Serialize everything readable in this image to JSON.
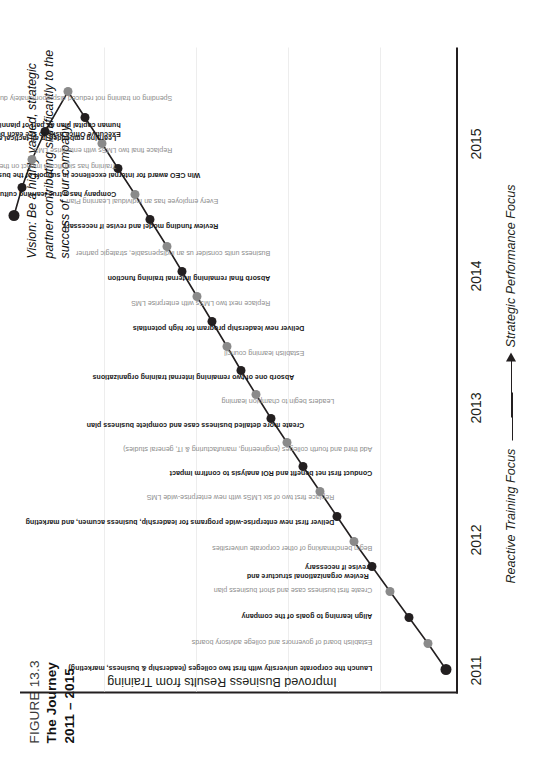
{
  "figure": {
    "number": "FIGURE 13.3",
    "title_line1": "The Journey",
    "title_line2": "2011 – 2015"
  },
  "vision": {
    "text": "Vision: Be a highly valued, strategic partner contributing significantly to the success of our company."
  },
  "axes": {
    "ylabel": "Improved Business Results from Training",
    "xticks": [
      "2011",
      "2012",
      "2013",
      "2014",
      "2015"
    ],
    "footer_left": "Reactive Training Focus",
    "footer_right": "Strategic Performance Focus"
  },
  "chart_data": {
    "type": "line",
    "title": "The Journey 2011 – 2015",
    "xlabel": "",
    "ylabel": "Improved Business Results from Training",
    "xlim": [
      2010.8,
      2015.6
    ],
    "ylim": [
      0,
      100
    ],
    "grid": true,
    "legend": null,
    "xticks": [
      "2011",
      "2012",
      "2013",
      "2014",
      "2015"
    ],
    "annotations": {
      "vision": "Vision: Be a highly valued, strategic partner contributing significantly to the success of our company.",
      "footer_left": "Reactive Training Focus",
      "footer_right": "Strategic Performance Focus"
    },
    "series": [
      {
        "name": "Journey milestones",
        "points": [
          {
            "x": 2011.0,
            "y": 2,
            "style": "dark",
            "label": "Launch the corporate university with first two colleges (leadership & business, marketing)"
          },
          {
            "x": 2011.17,
            "y": 6,
            "style": "gray",
            "label": "Establish board of governors and college advisory boards"
          },
          {
            "x": 2011.33,
            "y": 11,
            "style": "dark",
            "label": "Align learning to goals of the company"
          },
          {
            "x": 2011.5,
            "y": 16,
            "style": "gray",
            "label": "Create first business case and short business plan"
          },
          {
            "x": 2011.67,
            "y": 21,
            "style": "dark",
            "label": "Review organizational structure and revise if necessary"
          },
          {
            "x": 2011.84,
            "y": 26,
            "style": "gray",
            "label": "Begin benchmarking of other corporate universities"
          },
          {
            "x": 2012.0,
            "y": 31,
            "style": "dark",
            "label": "Deliver first new enterprise-wide programs for leadership, business acumen, and marketing"
          },
          {
            "x": 2012.17,
            "y": 36,
            "style": "gray",
            "label": "Replace first two of six LMSs with new enterprise-wide LMS"
          },
          {
            "x": 2012.34,
            "y": 41,
            "style": "dark",
            "label": "Conduct first net benefit and ROI analysis to confirm impact"
          },
          {
            "x": 2012.52,
            "y": 46,
            "style": "gray",
            "label": "Add third and fourth colleges (engineering, manufacturing & IT, general studies)"
          },
          {
            "x": 2012.7,
            "y": 51,
            "style": "dark",
            "label": "Create more detailed business case and complete business plan"
          },
          {
            "x": 2012.88,
            "y": 55,
            "style": "gray",
            "label": "Leaders begin to champion learning"
          },
          {
            "x": 2013.06,
            "y": 60,
            "style": "dark",
            "label": "Absorb one of two remaining internal training organizations"
          },
          {
            "x": 2013.26,
            "y": 64,
            "style": "gray",
            "label": "Establish learning council"
          },
          {
            "x": 2013.46,
            "y": 68,
            "style": "dark",
            "label": "Deliver new leadership program for high potentials"
          },
          {
            "x": 2013.7,
            "y": 72,
            "style": "gray",
            "label": "Replace next two LMSs with enterprise LMS"
          },
          {
            "x": 2013.94,
            "y": 76,
            "style": "dark",
            "label": "Absorb final remaining internal training function"
          },
          {
            "x": 2014.16,
            "y": 79,
            "style": "gray",
            "label": "Business units consider us an indispensable, strategic partner"
          },
          {
            "x": 2014.36,
            "y": 82,
            "style": "dark",
            "label": "Review funding model and revise if necessary"
          },
          {
            "x": 2014.56,
            "y": 85,
            "style": "gray",
            "label": "Every employee has an Individual Learning Plan"
          },
          {
            "x": 2014.8,
            "y": 88,
            "style": "dark",
            "label": "Win CEO award for internal excellence in support of the business"
          },
          {
            "x": 2015.04,
            "y": 90,
            "style": "gray",
            "label": "Replace final two LMSs with enterprise LMS"
          },
          {
            "x": 2015.28,
            "y": 93,
            "style": "dark",
            "label": "Executive Office asks to see each business unit's human capital plan as part of planning review"
          },
          {
            "x": 2015.52,
            "y": 95,
            "style": "gray",
            "label": "Spending on training not reduced disproportionately during downturns"
          },
          {
            "x": 2015.76,
            "y": 96,
            "style": "dark",
            "label": "Learning embedded in all tactical and strategic plans"
          },
          {
            "x": 2016.0,
            "y": 97,
            "style": "gray",
            "label": "Training has significant impact on the company's overall success"
          },
          {
            "x": 2016.24,
            "y": 98,
            "style": "dark",
            "label": "Company has a true learning culture"
          },
          {
            "x": 2016.48,
            "y": 99,
            "style": "dark",
            "label": ""
          }
        ]
      }
    ]
  },
  "milestones": [
    {
      "label": "Launch the corporate university with first two colleges (leadership & business, marketing)",
      "style": "dark",
      "px": 110,
      "py": 446,
      "lx": 112,
      "ly": 368
    },
    {
      "label": "Establish board of governors and college advisory boards",
      "style": "gray",
      "px": 136,
      "py": 428,
      "lx": 138,
      "ly": 368
    },
    {
      "label": "Align learning to goals of the company",
      "style": "dark",
      "px": 162,
      "py": 409,
      "lx": 164,
      "ly": 368
    },
    {
      "label": "Create first business case and short business plan",
      "style": "gray",
      "px": 188,
      "py": 390,
      "lx": 190,
      "ly": 368
    },
    {
      "label": "Review organizational structure and\nrevise if necessary",
      "style": "dark",
      "px": 213,
      "py": 372,
      "lx": 208,
      "ly": 360
    },
    {
      "label": "Begin benchmarking of other corporate universities",
      "style": "gray",
      "px": 238,
      "py": 354,
      "lx": 232,
      "ly": 368
    },
    {
      "label": "Deliver first new enterprise-wide programs for leadership, business acumen, and marketing",
      "style": "dark",
      "px": 263,
      "py": 337,
      "lx": 258,
      "ly": 330
    },
    {
      "label": "Replace first two of six LMSs with new enterprise-wide LMS",
      "style": "gray",
      "px": 288,
      "py": 320,
      "lx": 283,
      "ly": 330
    },
    {
      "label": "Conduct first net benefit and ROI analysis to confirm impact",
      "style": "dark",
      "px": 313,
      "py": 303,
      "lx": 307,
      "ly": 368
    },
    {
      "label": "Add third and fourth colleges (engineering, manufacturing & IT, general studies)",
      "style": "gray",
      "px": 337,
      "py": 287,
      "lx": 331,
      "ly": 368
    },
    {
      "label": "Create more detailed business case and complete business plan",
      "style": "dark",
      "px": 361,
      "py": 271,
      "lx": 355,
      "ly": 300
    },
    {
      "label": "Leaders begin to champion learning",
      "style": "gray",
      "px": 385,
      "py": 256,
      "lx": 379,
      "ly": 330
    },
    {
      "label": "Absorb one of two remaining internal training organizations",
      "style": "dark",
      "px": 409,
      "py": 241,
      "lx": 403,
      "ly": 290
    },
    {
      "label": "Establish learning council",
      "style": "gray",
      "px": 433,
      "py": 227,
      "lx": 427,
      "ly": 300
    },
    {
      "label": "Deliver new leadership program for high potentials",
      "style": "dark",
      "px": 458,
      "py": 212,
      "lx": 452,
      "ly": 300
    },
    {
      "label": "Replace next two LMSs with enterprise LMS",
      "style": "gray",
      "px": 483,
      "py": 197,
      "lx": 477,
      "ly": 266
    },
    {
      "label": "Absorb final remaining internal training function",
      "style": "dark",
      "px": 508,
      "py": 182,
      "lx": 502,
      "ly": 266
    },
    {
      "label": "Business units consider us an indispensable, strategic partner",
      "style": "gray",
      "px": 533,
      "py": 167,
      "lx": 527,
      "ly": 266
    },
    {
      "label": "Review funding model and revise if necessary",
      "style": "dark",
      "px": 560,
      "py": 150,
      "lx": 554,
      "ly": 214
    },
    {
      "label": "Every employee has an Individual Learning Plan",
      "style": "gray",
      "px": 585,
      "py": 135,
      "lx": 579,
      "ly": 214
    },
    {
      "label": "Win CEO award for internal excellence in support of the business",
      "style": "dark",
      "px": 611,
      "py": 118,
      "lx": 605,
      "ly": 196
    },
    {
      "label": "Replace final two LMSs with enterprise LMS",
      "style": "gray",
      "px": 636,
      "py": 102,
      "lx": 630,
      "ly": 168
    },
    {
      "label": "Executive Office asks to see each business unit's\nhuman capital plan as part of planning review",
      "style": "dark",
      "px": 662,
      "py": 85,
      "lx": 650,
      "ly": 112
    },
    {
      "label": "Spending on training not reduced disproportionately during downturns",
      "style": "gray",
      "px": 688,
      "py": 68,
      "lx": 682,
      "ly": 168
    },
    {
      "label": "Learning embedded in all tactical and strategic plans",
      "style": "dark",
      "px": 648,
      "py": 45,
      "lx": 642,
      "ly": 112
    },
    {
      "label": "Training has significant impact on the company's overall success",
      "style": "gray",
      "px": 620,
      "py": 32,
      "lx": 614,
      "ly": 112
    },
    {
      "label": "Company has a true learning culture",
      "style": "dark",
      "px": 592,
      "py": 22,
      "lx": 586,
      "ly": 112
    },
    {
      "label": "",
      "style": "dark",
      "px": 564,
      "py": 14,
      "lx": 560,
      "ly": 112
    }
  ]
}
